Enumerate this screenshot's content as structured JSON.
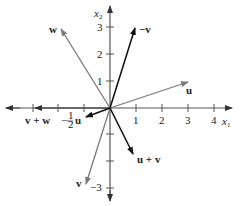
{
  "axes": {
    "x_label": "x",
    "x_sub": "1",
    "y_label": "x",
    "y_sub": "2",
    "x_ticks": [
      "1",
      "2",
      "3",
      "4"
    ],
    "y_ticks": [
      "1",
      "2",
      "3",
      "−3"
    ]
  },
  "vectors": {
    "u": "u",
    "neg_v": "−v",
    "w": "w",
    "v": "v",
    "u_plus_v": "u + v",
    "v_plus_w": "v + w",
    "neg_half_u_coef": "−",
    "neg_half_u_num": "1",
    "neg_half_u_den": "2",
    "neg_half_u_vec": "u"
  },
  "colors": {
    "dark_vector": "#111111",
    "gray_vector": "#7a7a7a",
    "axis": "#555555"
  }
}
